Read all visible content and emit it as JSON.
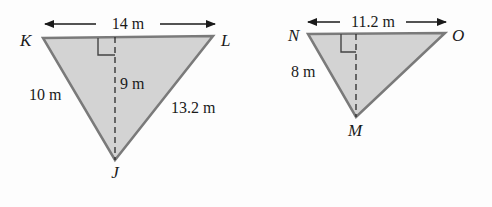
{
  "colors": {
    "fill": "#d3d3d3",
    "stroke": "#7a7a7a",
    "text": "#1a1a1a",
    "dash": "#2a2a2a"
  },
  "triangle_left": {
    "vertices": {
      "top_left": "K",
      "top_right": "L",
      "bottom": "J"
    },
    "top_length": "14 m",
    "left_side": "10 m",
    "right_side": "13.2 m",
    "height": "9 m"
  },
  "triangle_right": {
    "vertices": {
      "top_left": "N",
      "top_right": "O",
      "bottom": "M"
    },
    "top_length": "11.2 m",
    "left_side": "8 m",
    "height": ""
  }
}
